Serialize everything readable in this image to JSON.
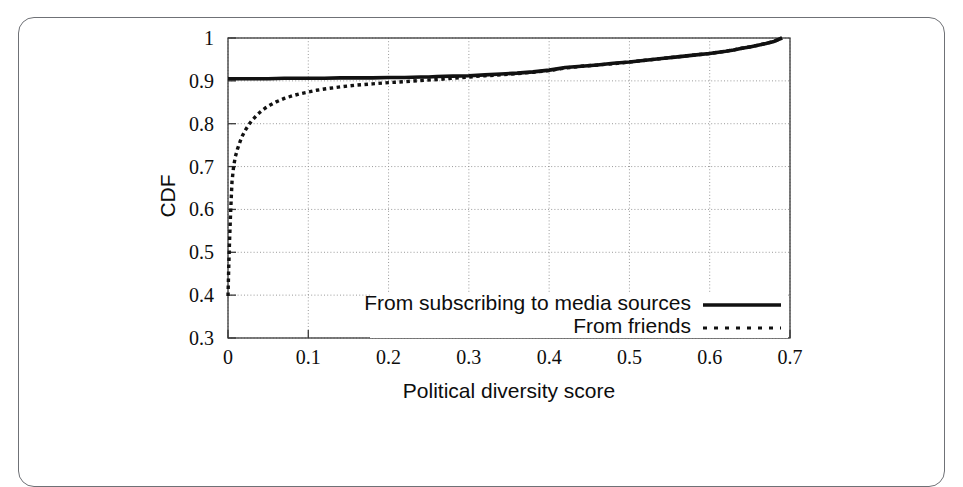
{
  "figure": {
    "frame_color": "#6f7176",
    "background": "#ffffff"
  },
  "chart_data": {
    "type": "line",
    "title": "",
    "subtitle": "",
    "xlabel": "Political diversity score",
    "ylabel": "CDF",
    "xlim": [
      0,
      0.7
    ],
    "ylim": [
      0.3,
      1.0
    ],
    "xticks": [
      "0",
      "0.1",
      "0.2",
      "0.3",
      "0.4",
      "0.5",
      "0.6",
      "0.7"
    ],
    "xtick_values": [
      0,
      0.1,
      0.2,
      0.3,
      0.4,
      0.5,
      0.6,
      0.7
    ],
    "yticks": [
      "0.3",
      "0.4",
      "0.5",
      "0.6",
      "0.7",
      "0.8",
      "0.9",
      "1"
    ],
    "ytick_values": [
      0.3,
      0.4,
      0.5,
      0.6,
      0.7,
      0.8,
      0.9,
      1.0
    ],
    "grid": true,
    "grid_style": "dotted",
    "grid_color": "#9a9a9a",
    "legend_position": "inside bottom-right",
    "line_color": "#111111",
    "series": [
      {
        "name": "From subscribing to media sources",
        "style": "solid",
        "x": [
          0.0,
          0.005,
          0.01,
          0.02,
          0.03,
          0.05,
          0.07,
          0.09,
          0.1,
          0.12,
          0.14,
          0.16,
          0.18,
          0.2,
          0.22,
          0.24,
          0.25,
          0.26,
          0.28,
          0.3,
          0.32,
          0.34,
          0.36,
          0.38,
          0.4,
          0.41,
          0.42,
          0.44,
          0.46,
          0.48,
          0.5,
          0.52,
          0.54,
          0.56,
          0.58,
          0.6,
          0.62,
          0.63,
          0.64,
          0.65,
          0.66,
          0.67,
          0.68,
          0.69
        ],
        "y": [
          0.905,
          0.905,
          0.905,
          0.905,
          0.905,
          0.905,
          0.906,
          0.906,
          0.906,
          0.906,
          0.907,
          0.907,
          0.907,
          0.908,
          0.908,
          0.909,
          0.909,
          0.91,
          0.911,
          0.912,
          0.914,
          0.916,
          0.918,
          0.921,
          0.925,
          0.928,
          0.931,
          0.934,
          0.937,
          0.941,
          0.944,
          0.948,
          0.952,
          0.956,
          0.96,
          0.964,
          0.969,
          0.972,
          0.976,
          0.979,
          0.983,
          0.987,
          0.992,
          1.0
        ]
      },
      {
        "name": "From friends",
        "style": "dotted",
        "x": [
          0.0,
          0.001,
          0.002,
          0.003,
          0.004,
          0.005,
          0.007,
          0.009,
          0.012,
          0.015,
          0.018,
          0.022,
          0.026,
          0.03,
          0.035,
          0.04,
          0.046,
          0.052,
          0.06,
          0.07,
          0.08,
          0.09,
          0.1,
          0.11,
          0.12,
          0.14,
          0.16,
          0.18,
          0.2,
          0.22,
          0.24,
          0.26,
          0.28,
          0.3,
          0.32,
          0.34,
          0.36,
          0.38,
          0.4,
          0.42,
          0.44,
          0.46,
          0.48,
          0.5,
          0.52,
          0.54,
          0.56,
          0.58,
          0.6,
          0.62,
          0.64,
          0.66,
          0.68,
          0.69
        ],
        "y": [
          0.398,
          0.47,
          0.53,
          0.58,
          0.625,
          0.665,
          0.7,
          0.722,
          0.742,
          0.758,
          0.772,
          0.786,
          0.798,
          0.808,
          0.818,
          0.827,
          0.836,
          0.843,
          0.851,
          0.859,
          0.865,
          0.87,
          0.874,
          0.878,
          0.881,
          0.886,
          0.89,
          0.893,
          0.896,
          0.898,
          0.901,
          0.903,
          0.906,
          0.909,
          0.912,
          0.914,
          0.917,
          0.92,
          0.924,
          0.93,
          0.934,
          0.937,
          0.94,
          0.944,
          0.948,
          0.952,
          0.956,
          0.96,
          0.964,
          0.969,
          0.976,
          0.983,
          0.992,
          1.0
        ]
      }
    ]
  },
  "legend": {
    "items": [
      {
        "label": "From subscribing to media sources",
        "style": "solid"
      },
      {
        "label": "From friends",
        "style": "dotted"
      }
    ]
  }
}
